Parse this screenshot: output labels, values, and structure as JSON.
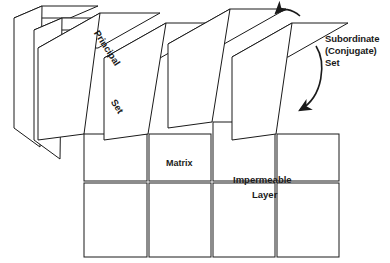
{
  "diagram": {
    "style": {
      "line_color": "#1a1a1a",
      "face_fill": "#ffffff",
      "stipple_color": "#3a3a3a",
      "background": "#ffffff",
      "line_width": 1.0
    },
    "labels": {
      "principal": "Principal",
      "set": "Set",
      "matrix": "Matrix",
      "impermeable": "Impermeable",
      "layer": "Layer",
      "subordinate_line1": "Subordinate",
      "subordinate_line2": "(Conjugate)",
      "subordinate_line3": "Set"
    },
    "icons": {
      "arrow_top": "curved-arrow-icon",
      "arrow_bottom": "curved-arrow-icon"
    },
    "annotations": [
      {
        "name": "principal-set-label",
        "text": "Principal",
        "rotation_deg": 57
      },
      {
        "name": "principal-set-label-2",
        "text": "Set",
        "rotation_deg": 57
      },
      {
        "name": "matrix-label",
        "text": "Matrix",
        "rotation_deg": 0
      },
      {
        "name": "impermeable-layer-label",
        "text": "Impermeable Layer",
        "rotation_deg": 0
      },
      {
        "name": "subordinate-conjugate-set-label",
        "text": "Subordinate (Conjugate) Set",
        "rotation_deg": 0
      }
    ],
    "geometry": {
      "column_count": 4,
      "row_count": 2,
      "stipple_dot_count": 210
    }
  }
}
